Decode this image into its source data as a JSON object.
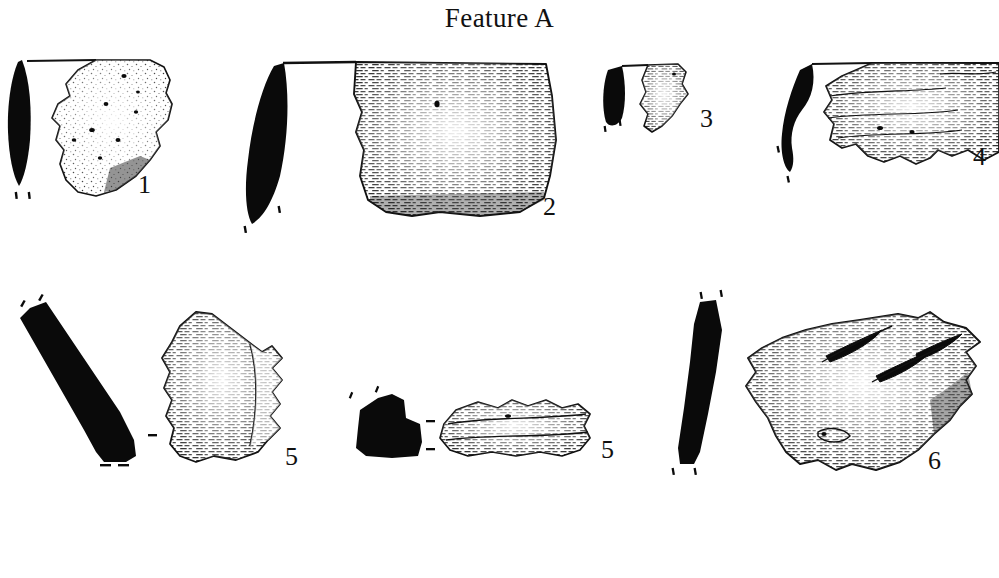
{
  "plate": {
    "title": "Feature A",
    "background_color": "#ffffff",
    "ink_color": "#111111",
    "subject": "archaeological pottery sherd illustration plate",
    "width": 999,
    "height": 578
  },
  "artifacts": [
    {
      "id": "artifact-1",
      "label": "1",
      "label_x": 138,
      "label_y": 172,
      "row": 1,
      "profile": "solid black lens-shaped vertical cross-section",
      "sherd": "irregular stippled body sherd with pitted surface and rim at top",
      "has_rim_line": true,
      "texture": "stipple"
    },
    {
      "id": "artifact-2",
      "label": "2",
      "label_x": 543,
      "label_y": 194,
      "row": 1,
      "profile": "solid black tapering vertical cross-section",
      "sherd": "large rectangular sherd with dense horizontal cord-marked dashes",
      "has_rim_line": true,
      "texture": "cord-marked"
    },
    {
      "id": "artifact-3",
      "label": "3",
      "label_x": 700,
      "label_y": 106,
      "row": 1,
      "profile": "short solid black rounded cross-section",
      "sherd": "small wedge-shaped sherd with horizontal dash texture",
      "has_rim_line": true,
      "texture": "cord-marked"
    },
    {
      "id": "artifact-4",
      "label": "4",
      "label_x": 973,
      "label_y": 144,
      "row": 1,
      "profile": "solid black S-curved cross-section",
      "sherd": "wide sherd with banded horizontal dash texture extending to plate edge",
      "has_rim_line": true,
      "texture": "cord-marked"
    },
    {
      "id": "artifact-5-left",
      "label": "5",
      "label_x": 285,
      "label_y": 444,
      "row": 2,
      "profile": "long diagonal solid black cross-section with flared foot",
      "sherd": "angular sherd with dense vertical-to-horizontal dash texture",
      "has_rim_line": false,
      "texture": "cord-marked"
    },
    {
      "id": "artifact-5-right",
      "label": "5",
      "label_x": 601,
      "label_y": 437,
      "row": 2,
      "profile": "blocky solid black cross-section",
      "sherd": "low wide elongated sherd with horizontal dash texture",
      "has_rim_line": false,
      "texture": "cord-marked"
    },
    {
      "id": "artifact-6",
      "label": "6",
      "label_x": 928,
      "label_y": 448,
      "row": 2,
      "profile": "slightly curved elongated solid black cross-section",
      "sherd": "large ovoid sherd with horizontal dash texture and lens-shaped incised gouges",
      "has_rim_line": false,
      "texture": "cord-marked-incised"
    }
  ]
}
